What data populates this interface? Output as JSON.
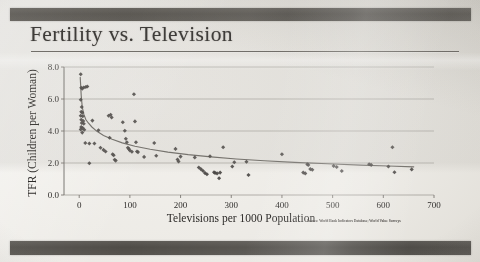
{
  "slide": {
    "title": "Fertility vs. Television",
    "source_note": "Source: World Bank Indicators Database; World Value Surveys",
    "band_color": "#4f4c47",
    "paper_color": "#ecebe6"
  },
  "chart_data": {
    "type": "scatter",
    "title": "Fertility vs. Television",
    "xlabel": "Televisions per 1000 Population",
    "ylabel": "TFR (Children per Woman)",
    "xlim": [
      -30,
      700
    ],
    "ylim": [
      0,
      8
    ],
    "xticks": [
      0,
      100,
      200,
      300,
      400,
      500,
      600,
      700
    ],
    "xtick_labels": [
      "0",
      "100",
      "200",
      "300",
      "400",
      "500",
      "600",
      "700"
    ],
    "yticks": [
      0,
      2,
      4,
      6,
      8
    ],
    "ytick_labels": [
      "0.0",
      "2.0",
      "4.0",
      "6.0",
      "8.0"
    ],
    "grid": "horizontal",
    "legend": "none",
    "marker": "diamond",
    "marker_color": "#4a4744",
    "trendline": {
      "label": "power/log fit",
      "color": "#6e6b66",
      "points": [
        [
          2,
          7.35
        ],
        [
          4,
          6.2
        ],
        [
          6,
          5.5
        ],
        [
          9,
          5.05
        ],
        [
          13,
          4.72
        ],
        [
          18,
          4.5
        ],
        [
          25,
          4.25
        ],
        [
          35,
          3.98
        ],
        [
          48,
          3.72
        ],
        [
          65,
          3.48
        ],
        [
          85,
          3.26
        ],
        [
          110,
          3.05
        ],
        [
          140,
          2.86
        ],
        [
          175,
          2.68
        ],
        [
          215,
          2.52
        ],
        [
          260,
          2.38
        ],
        [
          310,
          2.25
        ],
        [
          365,
          2.14
        ],
        [
          425,
          2.04
        ],
        [
          490,
          1.95
        ],
        [
          555,
          1.87
        ],
        [
          610,
          1.81
        ],
        [
          660,
          1.76
        ]
      ]
    },
    "points": [
      [
        3,
        7.55
      ],
      [
        4,
        6.7
      ],
      [
        6,
        6.65
      ],
      [
        9,
        6.72
      ],
      [
        13,
        6.75
      ],
      [
        16,
        6.78
      ],
      [
        3,
        5.95
      ],
      [
        5,
        5.5
      ],
      [
        4,
        5.2
      ],
      [
        6,
        5.15
      ],
      [
        3,
        4.95
      ],
      [
        7,
        4.92
      ],
      [
        4,
        4.7
      ],
      [
        8,
        4.62
      ],
      [
        5,
        4.5
      ],
      [
        9,
        4.45
      ],
      [
        4,
        4.25
      ],
      [
        7,
        4.18
      ],
      [
        3,
        4.1
      ],
      [
        10,
        4.08
      ],
      [
        6,
        3.9
      ],
      [
        12,
        3.25
      ],
      [
        20,
        3.22
      ],
      [
        26,
        4.65
      ],
      [
        30,
        3.22
      ],
      [
        38,
        4.05
      ],
      [
        42,
        2.95
      ],
      [
        48,
        2.82
      ],
      [
        52,
        2.72
      ],
      [
        58,
        4.95
      ],
      [
        62,
        5.02
      ],
      [
        64,
        4.85
      ],
      [
        66,
        2.55
      ],
      [
        68,
        2.48
      ],
      [
        70,
        2.2
      ],
      [
        72,
        2.15
      ],
      [
        60,
        3.58
      ],
      [
        20,
        1.98
      ],
      [
        86,
        4.55
      ],
      [
        90,
        4.02
      ],
      [
        92,
        3.52
      ],
      [
        94,
        3.3
      ],
      [
        96,
        2.95
      ],
      [
        98,
        2.88
      ],
      [
        100,
        2.78
      ],
      [
        104,
        2.7
      ],
      [
        108,
        6.3
      ],
      [
        110,
        4.6
      ],
      [
        112,
        3.3
      ],
      [
        114,
        2.72
      ],
      [
        116,
        2.68
      ],
      [
        128,
        2.38
      ],
      [
        148,
        3.25
      ],
      [
        152,
        2.45
      ],
      [
        190,
        2.88
      ],
      [
        194,
        2.22
      ],
      [
        196,
        2.1
      ],
      [
        200,
        2.4
      ],
      [
        228,
        2.35
      ],
      [
        236,
        1.72
      ],
      [
        240,
        1.62
      ],
      [
        244,
        1.52
      ],
      [
        248,
        1.38
      ],
      [
        252,
        1.3
      ],
      [
        258,
        2.42
      ],
      [
        266,
        1.42
      ],
      [
        268,
        1.38
      ],
      [
        272,
        1.35
      ],
      [
        276,
        1.05
      ],
      [
        278,
        1.4
      ],
      [
        284,
        2.98
      ],
      [
        302,
        1.78
      ],
      [
        306,
        2.05
      ],
      [
        330,
        2.08
      ],
      [
        334,
        1.25
      ],
      [
        400,
        2.55
      ],
      [
        442,
        1.4
      ],
      [
        446,
        1.35
      ],
      [
        450,
        1.92
      ],
      [
        452,
        1.88
      ],
      [
        456,
        1.62
      ],
      [
        460,
        1.58
      ],
      [
        502,
        1.82
      ],
      [
        508,
        1.75
      ],
      [
        518,
        1.5
      ],
      [
        572,
        1.92
      ],
      [
        576,
        1.88
      ],
      [
        610,
        1.78
      ],
      [
        618,
        2.98
      ],
      [
        622,
        1.42
      ],
      [
        656,
        1.6
      ]
    ]
  }
}
